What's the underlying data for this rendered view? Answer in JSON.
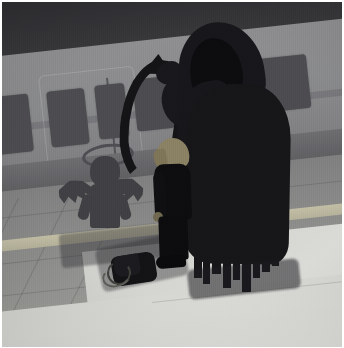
{
  "image": {
    "title": "Grim reaper and child at train platform",
    "alt_text": "Illustration of a hooded grim reaper holding a scythe bending over a small boy on a subway platform, while the boy's shadow on the train is an angel with wings and a halo",
    "medium": "digital illustration",
    "palette": {
      "background_wall": "#8c8c8e",
      "train_body": "#898a8c",
      "train_window": "#4c4c50",
      "roof_band": "#303033",
      "platform": "#9a9a97",
      "platform_lit": "#e3e3df",
      "tactile_strip": "#c8c4a8",
      "reaper_black": "#16161a",
      "boy_black": "#0d0d10",
      "boy_hair": "#8a8063",
      "angel_shadow": "#3f3f44",
      "matte_white": "#ffffff"
    },
    "scene": {
      "setting": "subway station platform alongside a stopped train",
      "lighting": "overhead platform light from the lower right casting long shadows toward the upper left",
      "mood": "somber, quiet"
    },
    "elements": [
      {
        "id": "train",
        "label": "Subway train car",
        "description": "Grey train car seen at an angle with a row of dark rectangular windows and a sliding door outline"
      },
      {
        "id": "platform",
        "label": "Tiled platform floor",
        "description": "Grey tiled platform with a pale yellow tactile warning strip running along the edge"
      },
      {
        "id": "reaper",
        "label": "Hooded grim reaper",
        "description": "Tall black hooded figure bending forward over the boy, robe ending in torn vertical tatters"
      },
      {
        "id": "scythe",
        "label": "Scythe",
        "description": "Large curved black scythe blade arcing over the boy's head"
      },
      {
        "id": "boy",
        "label": "Small boy",
        "description": "Child in a dark suit with light blond hair, standing with head bowed"
      },
      {
        "id": "angel-shadow",
        "label": "Angel shadow",
        "description": "The boy's shadow cast on the train shows a winged angel with a halo"
      },
      {
        "id": "bag",
        "label": "Backpack on the ground",
        "description": "Small dark backpack set down on the platform beside the boy"
      }
    ],
    "train_windows_count": 6,
    "dimensions": {
      "width": 344,
      "height": 348
    }
  }
}
